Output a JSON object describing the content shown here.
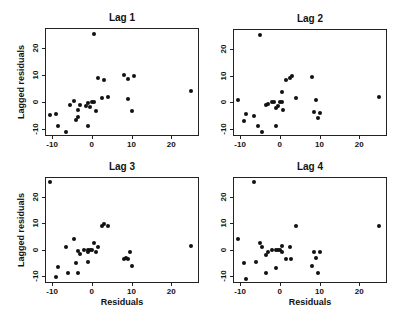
{
  "chart_data": [
    {
      "type": "scatter",
      "title": "Lag 1",
      "xlabel": "",
      "ylabel": "Lagged residuals",
      "xlim": [
        -11.8,
        27
      ],
      "ylim": [
        -12.6,
        27.4
      ],
      "xticks": [
        "-10",
        "0",
        "10",
        "20"
      ],
      "yticks": [
        "-10",
        "0",
        "10",
        "20"
      ],
      "grid": false,
      "points": [
        [
          -10.5,
          -5
        ],
        [
          -9,
          -4.5
        ],
        [
          -8.5,
          -9
        ],
        [
          -6.5,
          -11
        ],
        [
          -5.5,
          -1
        ],
        [
          -4.5,
          0.5
        ],
        [
          -4,
          -6.5
        ],
        [
          -3.5,
          -5.5
        ],
        [
          -3.5,
          -3
        ],
        [
          -3,
          -1
        ],
        [
          -1.5,
          -1.5
        ],
        [
          -1,
          -0.5
        ],
        [
          -0.5,
          -2
        ],
        [
          -1,
          -9
        ],
        [
          0,
          0
        ],
        [
          0.5,
          0
        ],
        [
          1,
          -3.5
        ],
        [
          0.5,
          25
        ],
        [
          1.5,
          9
        ],
        [
          2.5,
          1.5
        ],
        [
          3,
          8
        ],
        [
          4,
          2
        ],
        [
          8,
          10
        ],
        [
          9,
          1
        ],
        [
          9,
          8.5
        ],
        [
          10,
          -3.5
        ],
        [
          10.5,
          9.5
        ],
        [
          25,
          4
        ]
      ]
    },
    {
      "type": "scatter",
      "title": "Lag 2",
      "xlabel": "",
      "ylabel": "",
      "xlim": [
        -11.8,
        27
      ],
      "ylim": [
        -12.6,
        27.4
      ],
      "xticks": [
        "-10",
        "0",
        "10",
        "20"
      ],
      "yticks": [
        "-10",
        "0",
        "10",
        "20"
      ],
      "grid": false,
      "points": [
        [
          -10.5,
          1
        ],
        [
          -9,
          -7
        ],
        [
          -8.5,
          -4.5
        ],
        [
          -6.5,
          -5
        ],
        [
          -5.5,
          -9
        ],
        [
          -4.5,
          -11
        ],
        [
          -5,
          25
        ],
        [
          -3.5,
          -1
        ],
        [
          -3,
          -0.5
        ],
        [
          -2,
          0
        ],
        [
          -1.5,
          0
        ],
        [
          -1,
          -2
        ],
        [
          -0.5,
          -1.5
        ],
        [
          -1,
          -9
        ],
        [
          0,
          0
        ],
        [
          0.5,
          0
        ],
        [
          0.5,
          4
        ],
        [
          0.8,
          -3
        ],
        [
          1.5,
          8.5
        ],
        [
          2.5,
          9
        ],
        [
          3,
          10
        ],
        [
          4,
          1.5
        ],
        [
          8,
          9.5
        ],
        [
          8.5,
          -3.5
        ],
        [
          9,
          1
        ],
        [
          9.5,
          -6
        ],
        [
          10,
          -4
        ],
        [
          25,
          2
        ]
      ]
    },
    {
      "type": "scatter",
      "title": "Lag 3",
      "xlabel": "Residuals",
      "ylabel": "Lagged residuals",
      "xlim": [
        -11.8,
        27
      ],
      "ylim": [
        -12.6,
        27.4
      ],
      "xticks": [
        "-10",
        "0",
        "10",
        "20"
      ],
      "yticks": [
        "-10",
        "0",
        "10",
        "20"
      ],
      "grid": false,
      "points": [
        [
          -10.5,
          25.5
        ],
        [
          -9,
          -10.5
        ],
        [
          -8.5,
          -6.5
        ],
        [
          -6.5,
          1
        ],
        [
          -6,
          -9
        ],
        [
          -4.5,
          4
        ],
        [
          -4,
          -5
        ],
        [
          -3.5,
          -9
        ],
        [
          -3.5,
          -0.5
        ],
        [
          -3,
          -1.5
        ],
        [
          -2,
          0
        ],
        [
          -1,
          0
        ],
        [
          -1,
          -4.5
        ],
        [
          -1,
          -1
        ],
        [
          -0.5,
          0
        ],
        [
          0,
          0
        ],
        [
          0.5,
          2.5
        ],
        [
          1,
          -1
        ],
        [
          1.5,
          1
        ],
        [
          2.5,
          9
        ],
        [
          3,
          9.5
        ],
        [
          4,
          9
        ],
        [
          8,
          -3.5
        ],
        [
          8.5,
          -3
        ],
        [
          9,
          -3.5
        ],
        [
          9.5,
          -1
        ],
        [
          10,
          -6
        ],
        [
          25,
          1.5
        ]
      ]
    },
    {
      "type": "scatter",
      "title": "Lag 4",
      "xlabel": "Residuals",
      "ylabel": "",
      "xlim": [
        -11.8,
        27
      ],
      "ylim": [
        -12.6,
        27.4
      ],
      "xticks": [
        "-10",
        "0",
        "10",
        "20"
      ],
      "yticks": [
        "-10",
        "0",
        "10",
        "20"
      ],
      "grid": false,
      "points": [
        [
          -10.5,
          4
        ],
        [
          -9,
          -5
        ],
        [
          -8.5,
          -11
        ],
        [
          -6.5,
          25.5
        ],
        [
          -6,
          -4.5
        ],
        [
          -5,
          2.5
        ],
        [
          -4.5,
          1
        ],
        [
          -3.5,
          -9
        ],
        [
          -3.5,
          -2
        ],
        [
          -3,
          -1
        ],
        [
          -2,
          0
        ],
        [
          -1,
          0
        ],
        [
          -1,
          -7
        ],
        [
          -0.5,
          0
        ],
        [
          0,
          0
        ],
        [
          0.5,
          1.5
        ],
        [
          0.5,
          -1
        ],
        [
          1.5,
          -3.5
        ],
        [
          2.5,
          1
        ],
        [
          2.8,
          -3.5
        ],
        [
          4,
          9
        ],
        [
          8,
          -6
        ],
        [
          8.5,
          -1
        ],
        [
          9,
          -3
        ],
        [
          9.5,
          -9
        ],
        [
          10,
          -1
        ],
        [
          25,
          9
        ]
      ]
    }
  ],
  "panels": [
    {
      "title": "Lag 1",
      "ylabel": "Lagged residuals",
      "xlabel": ""
    },
    {
      "title": "Lag 2",
      "ylabel": "",
      "xlabel": ""
    },
    {
      "title": "Lag 3",
      "ylabel": "Lagged residuals",
      "xlabel": "Residuals"
    },
    {
      "title": "Lag 4",
      "ylabel": "",
      "xlabel": "Residuals"
    }
  ]
}
